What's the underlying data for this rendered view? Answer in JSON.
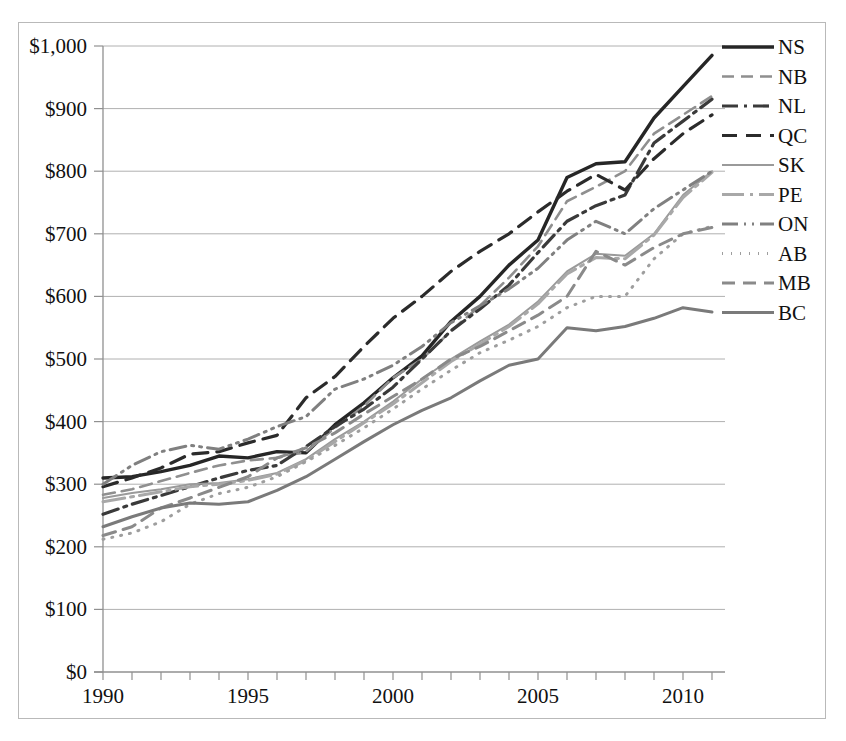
{
  "chart_data": {
    "type": "line",
    "title": "",
    "xlabel": "",
    "ylabel": "",
    "xlim": [
      1990,
      2011
    ],
    "ylim": [
      0,
      1000
    ],
    "grid": true,
    "legend_position": "right",
    "currency_prefix": "$",
    "x": [
      1990,
      1991,
      1992,
      1993,
      1994,
      1995,
      1996,
      1997,
      1998,
      1999,
      2000,
      2001,
      2002,
      2003,
      2004,
      2005,
      2006,
      2007,
      2008,
      2009,
      2010,
      2011
    ],
    "xticks": [
      1990,
      1995,
      2000,
      2005,
      2010
    ],
    "xtick_labels": [
      "1990",
      "1995",
      "2000",
      "2005",
      "2010"
    ],
    "yticks": [
      0,
      100,
      200,
      300,
      400,
      500,
      600,
      700,
      800,
      900,
      1000
    ],
    "ytick_labels": [
      "$0",
      "$100",
      "$200",
      "$300",
      "$400",
      "$500",
      "$600",
      "$700",
      "$800",
      "$900",
      "$1,000"
    ],
    "series": [
      {
        "name": "NS",
        "color": "#262626",
        "width": 3.4,
        "dash": "none",
        "values": [
          310,
          312,
          320,
          330,
          345,
          342,
          352,
          350,
          395,
          430,
          470,
          505,
          560,
          600,
          650,
          690,
          790,
          812,
          815,
          885,
          935,
          985
        ]
      },
      {
        "name": "NB",
        "color": "#8f8f8f",
        "width": 2.6,
        "dash": "12,7",
        "values": [
          283,
          292,
          305,
          318,
          330,
          338,
          342,
          352,
          390,
          425,
          470,
          500,
          545,
          585,
          630,
          680,
          752,
          775,
          800,
          860,
          890,
          920
        ]
      },
      {
        "name": "NL",
        "color": "#3a3a3a",
        "width": 3.2,
        "dash": "16,6,3,6",
        "values": [
          252,
          268,
          282,
          296,
          310,
          322,
          330,
          360,
          392,
          420,
          455,
          500,
          545,
          580,
          618,
          670,
          720,
          745,
          762,
          845,
          880,
          915
        ]
      },
      {
        "name": "QC",
        "color": "#2b2b2b",
        "width": 3.2,
        "dash": "15,9",
        "values": [
          296,
          310,
          326,
          348,
          352,
          366,
          378,
          438,
          472,
          520,
          565,
          600,
          640,
          672,
          700,
          735,
          768,
          795,
          770,
          820,
          860,
          890
        ]
      },
      {
        "name": "SK",
        "color": "#9a9a9a",
        "width": 2.0,
        "dash": "none",
        "values": [
          278,
          286,
          292,
          300,
          302,
          308,
          318,
          340,
          372,
          400,
          432,
          468,
          500,
          528,
          555,
          592,
          640,
          668,
          665,
          700,
          762,
          800
        ]
      },
      {
        "name": "PE",
        "color": "#a8a8a8",
        "width": 3.0,
        "dash": "22,6,3,6",
        "values": [
          272,
          280,
          288,
          296,
          300,
          306,
          316,
          338,
          368,
          398,
          428,
          462,
          496,
          524,
          552,
          588,
          636,
          662,
          660,
          698,
          758,
          798
        ]
      },
      {
        "name": "ON",
        "color": "#808080",
        "width": 3.0,
        "dash": "16,6,2,6,2,6",
        "values": [
          300,
          330,
          352,
          362,
          356,
          372,
          392,
          408,
          452,
          468,
          490,
          520,
          558,
          585,
          612,
          645,
          690,
          720,
          700,
          740,
          770,
          800
        ]
      },
      {
        "name": "AB",
        "color": "#9e9e9e",
        "width": 3.0,
        "dash": "1,8",
        "values": [
          212,
          222,
          240,
          268,
          285,
          295,
          312,
          336,
          362,
          390,
          420,
          452,
          482,
          510,
          530,
          552,
          582,
          600,
          600,
          660,
          700,
          712
        ]
      },
      {
        "name": "MB",
        "color": "#8a8a8a",
        "width": 3.0,
        "dash": "13,8",
        "values": [
          218,
          232,
          262,
          278,
          295,
          312,
          342,
          358,
          382,
          412,
          440,
          468,
          500,
          520,
          545,
          570,
          600,
          672,
          650,
          678,
          700,
          710
        ]
      },
      {
        "name": "BC",
        "color": "#7a7a7a",
        "width": 3.0,
        "dash": "none",
        "values": [
          232,
          248,
          262,
          270,
          268,
          272,
          290,
          312,
          340,
          368,
          395,
          418,
          438,
          465,
          490,
          500,
          550,
          545,
          552,
          565,
          582,
          575
        ]
      }
    ]
  },
  "legend": {
    "items": [
      {
        "label": "NS"
      },
      {
        "label": "NB"
      },
      {
        "label": "NL"
      },
      {
        "label": "QC"
      },
      {
        "label": "SK"
      },
      {
        "label": "PE"
      },
      {
        "label": "ON"
      },
      {
        "label": "AB"
      },
      {
        "label": "MB"
      },
      {
        "label": "BC"
      }
    ]
  },
  "colors": {
    "grid": "#b0b0b0",
    "axis": "#909090",
    "frame": "#b9b9b9",
    "text": "#111111"
  }
}
